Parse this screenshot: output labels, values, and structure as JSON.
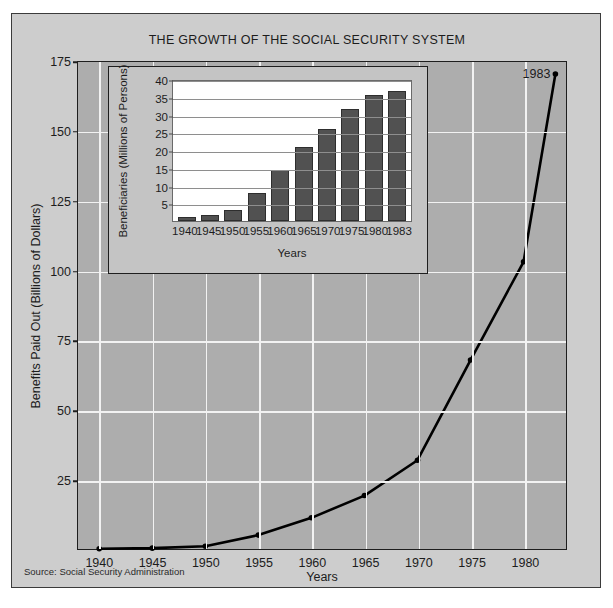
{
  "figure": {
    "title": "THE GROWTH OF THE SOCIAL SECURITY SYSTEM",
    "source": "Source: Social Security Administration",
    "colors": {
      "card_background": "#cdcdcd",
      "plot_background": "#adadad",
      "gridline": "#f2f2f2",
      "line": "#000000",
      "bar_fill": "#515151",
      "inset_background": "#c4c4c4",
      "inset_plot_background": "#ffffff",
      "frame": "#1e1e1e",
      "text": "#1c1c1c"
    }
  },
  "chart_data": [
    {
      "type": "line",
      "id": "main-benefits-paid-out",
      "title": "THE GROWTH OF THE SOCIAL SECURITY SYSTEM",
      "xlabel": "Years",
      "ylabel": "Benefits Paid Out (Billions of Dollars)",
      "x": [
        1940,
        1945,
        1950,
        1955,
        1960,
        1965,
        1970,
        1975,
        1980,
        1983
      ],
      "values": [
        0.1,
        0.3,
        1.0,
        5.0,
        11.2,
        19.2,
        31.9,
        67.9,
        103.2,
        170.7
      ],
      "xlim": [
        1938,
        1984
      ],
      "ylim": [
        0,
        175
      ],
      "yticks": [
        25,
        50,
        75,
        100,
        125,
        150,
        175
      ],
      "xticks": [
        1940,
        1945,
        1950,
        1955,
        1960,
        1965,
        1970,
        1975,
        1980
      ],
      "grid": true,
      "legend": "none",
      "markers": true,
      "annotations": [
        {
          "text": "1983",
          "x": 1983,
          "y": 170.7,
          "position": "left"
        }
      ]
    },
    {
      "type": "bar",
      "id": "inset-beneficiaries",
      "title": "",
      "xlabel": "Years",
      "ylabel": "Beneficiaries (Millions of Persons)",
      "categories": [
        "1940",
        "1945",
        "1950",
        "1955",
        "1960",
        "1965",
        "1970",
        "1975",
        "1980",
        "1983"
      ],
      "values": [
        1.0,
        1.7,
        3.1,
        7.8,
        14.5,
        20.9,
        25.9,
        31.5,
        35.6,
        36.5
      ],
      "ylim": [
        0,
        40
      ],
      "yticks": [
        5,
        10,
        15,
        20,
        25,
        30,
        35,
        40
      ],
      "grid": true,
      "legend": "none"
    }
  ]
}
